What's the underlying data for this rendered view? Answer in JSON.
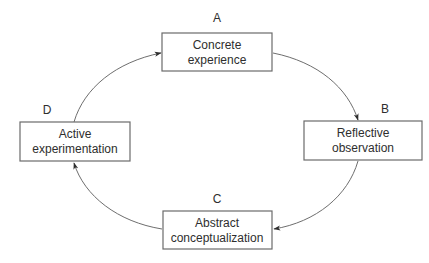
{
  "diagram": {
    "type": "cycle",
    "stages": [
      {
        "id": "A",
        "label": "A",
        "lines": [
          "Concrete",
          "experience"
        ]
      },
      {
        "id": "B",
        "label": "B",
        "lines": [
          "Reflective",
          "observation"
        ]
      },
      {
        "id": "C",
        "label": "C",
        "lines": [
          "Abstract",
          "conceptualization"
        ]
      },
      {
        "id": "D",
        "label": "D",
        "lines": [
          "Active",
          "experimentation"
        ]
      }
    ],
    "flow": [
      {
        "from": "A",
        "to": "B"
      },
      {
        "from": "B",
        "to": "C"
      },
      {
        "from": "C",
        "to": "D"
      },
      {
        "from": "D",
        "to": "A"
      }
    ],
    "colors": {
      "stroke": "#6b6b6b",
      "text": "#2e2e2e",
      "background": "#ffffff"
    }
  }
}
